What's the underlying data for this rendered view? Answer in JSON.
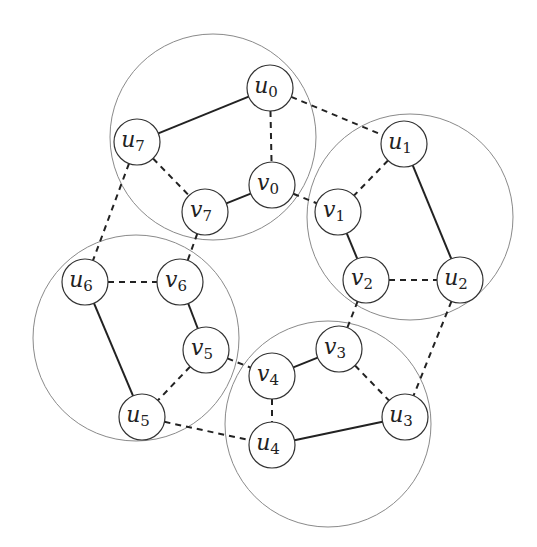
{
  "diagram": {
    "type": "graph",
    "groups": [
      {
        "id": "top",
        "cx": 213,
        "cy": 137,
        "r": 103,
        "members": [
          "u0",
          "u7",
          "v7",
          "v0"
        ]
      },
      {
        "id": "right",
        "cx": 410,
        "cy": 217,
        "r": 103,
        "members": [
          "u1",
          "v1",
          "v2",
          "u2"
        ]
      },
      {
        "id": "left",
        "cx": 136,
        "cy": 338,
        "r": 103,
        "members": [
          "u6",
          "v6",
          "v5",
          "u5"
        ]
      },
      {
        "id": "bottom",
        "cx": 328,
        "cy": 424,
        "r": 103,
        "members": [
          "v4",
          "v3",
          "u3",
          "u4"
        ]
      }
    ],
    "nodes": [
      {
        "id": "u0",
        "base": "u",
        "sub": "0",
        "x": 270,
        "y": 88
      },
      {
        "id": "u7",
        "base": "u",
        "sub": "7",
        "x": 137,
        "y": 142
      },
      {
        "id": "v7",
        "base": "v",
        "sub": "7",
        "x": 205,
        "y": 212
      },
      {
        "id": "v0",
        "base": "v",
        "sub": "0",
        "x": 272,
        "y": 185
      },
      {
        "id": "u1",
        "base": "u",
        "sub": "1",
        "x": 404,
        "y": 144
      },
      {
        "id": "v1",
        "base": "v",
        "sub": "1",
        "x": 338,
        "y": 212
      },
      {
        "id": "v2",
        "base": "v",
        "sub": "2",
        "x": 366,
        "y": 280
      },
      {
        "id": "u2",
        "base": "u",
        "sub": "2",
        "x": 460,
        "y": 280
      },
      {
        "id": "u6",
        "base": "u",
        "sub": "6",
        "x": 85,
        "y": 282
      },
      {
        "id": "v6",
        "base": "v",
        "sub": "6",
        "x": 180,
        "y": 282
      },
      {
        "id": "v5",
        "base": "v",
        "sub": "5",
        "x": 206,
        "y": 350
      },
      {
        "id": "u5",
        "base": "u",
        "sub": "5",
        "x": 142,
        "y": 417
      },
      {
        "id": "v4",
        "base": "v",
        "sub": "4",
        "x": 272,
        "y": 376
      },
      {
        "id": "v3",
        "base": "v",
        "sub": "3",
        "x": 339,
        "y": 349
      },
      {
        "id": "u3",
        "base": "u",
        "sub": "3",
        "x": 405,
        "y": 417
      },
      {
        "id": "u4",
        "base": "u",
        "sub": "4",
        "x": 272,
        "y": 445
      }
    ],
    "node_radius": 23,
    "edges": [
      {
        "from": "u0",
        "to": "u7",
        "style": "solid"
      },
      {
        "from": "v0",
        "to": "v7",
        "style": "solid"
      },
      {
        "from": "u0",
        "to": "v0",
        "style": "dashed"
      },
      {
        "from": "u7",
        "to": "v7",
        "style": "dashed"
      },
      {
        "from": "u1",
        "to": "u2",
        "style": "solid"
      },
      {
        "from": "v1",
        "to": "v2",
        "style": "solid"
      },
      {
        "from": "u1",
        "to": "v1",
        "style": "dashed"
      },
      {
        "from": "v2",
        "to": "u2",
        "style": "dashed"
      },
      {
        "from": "u6",
        "to": "u5",
        "style": "solid"
      },
      {
        "from": "v6",
        "to": "v5",
        "style": "solid"
      },
      {
        "from": "u6",
        "to": "v6",
        "style": "dashed"
      },
      {
        "from": "v5",
        "to": "u5",
        "style": "dashed"
      },
      {
        "from": "v4",
        "to": "v3",
        "style": "solid"
      },
      {
        "from": "u4",
        "to": "u3",
        "style": "solid"
      },
      {
        "from": "v3",
        "to": "u3",
        "style": "dashed"
      },
      {
        "from": "v4",
        "to": "u4",
        "style": "dashed"
      },
      {
        "from": "u0",
        "to": "u1",
        "style": "dashed"
      },
      {
        "from": "v0",
        "to": "v1",
        "style": "dashed"
      },
      {
        "from": "u7",
        "to": "u6",
        "style": "dashed"
      },
      {
        "from": "v7",
        "to": "v6",
        "style": "dashed"
      },
      {
        "from": "v2",
        "to": "v3",
        "style": "dashed"
      },
      {
        "from": "u2",
        "to": "u3",
        "style": "dashed"
      },
      {
        "from": "v5",
        "to": "v4",
        "style": "dashed"
      },
      {
        "from": "u5",
        "to": "u4",
        "style": "dashed"
      }
    ]
  }
}
